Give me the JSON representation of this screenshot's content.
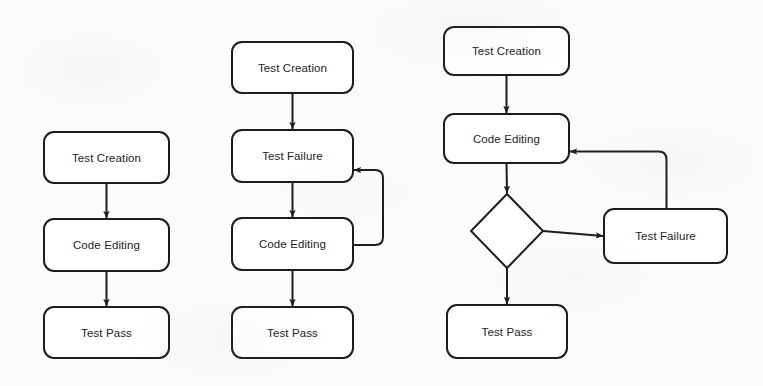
{
  "diagram": {
    "background_color": "#fbfbfa",
    "stroke_color": "#1d1d1d",
    "text_color": "#1d1d1d",
    "node_fill": "#ffffff",
    "stroke_width": 2,
    "corner_radius": 10,
    "flowcharts": [
      {
        "id": "flowchart-a",
        "name": "simple-linear-flow",
        "nodes": [
          {
            "id": "a1",
            "label": "Test Creation",
            "shape": "rounded-rect",
            "x": 44,
            "y": 132,
            "w": 125,
            "h": 51
          },
          {
            "id": "a2",
            "label": "Code Editing",
            "shape": "rounded-rect",
            "x": 44,
            "y": 219,
            "w": 125,
            "h": 52
          },
          {
            "id": "a3",
            "label": "Test Pass",
            "shape": "rounded-rect",
            "x": 44,
            "y": 307,
            "w": 125,
            "h": 51
          }
        ],
        "edges": [
          {
            "from": "a1",
            "to": "a2",
            "type": "straight-down",
            "arrow": true
          },
          {
            "from": "a2",
            "to": "a3",
            "type": "straight-down",
            "arrow": true
          }
        ]
      },
      {
        "id": "flowchart-b",
        "name": "loop-back-flow",
        "nodes": [
          {
            "id": "b1",
            "label": "Test Creation",
            "shape": "rounded-rect",
            "x": 232,
            "y": 42,
            "w": 121,
            "h": 51
          },
          {
            "id": "b2",
            "label": "Test Failure",
            "shape": "rounded-rect",
            "x": 232,
            "y": 130,
            "w": 121,
            "h": 52
          },
          {
            "id": "b3",
            "label": "Code Editing",
            "shape": "rounded-rect",
            "x": 232,
            "y": 218,
            "w": 121,
            "h": 52
          },
          {
            "id": "b4",
            "label": "Test Pass",
            "shape": "rounded-rect",
            "x": 232,
            "y": 307,
            "w": 121,
            "h": 51
          }
        ],
        "edges": [
          {
            "from": "b1",
            "to": "b2",
            "type": "straight-down",
            "arrow": true
          },
          {
            "from": "b2",
            "to": "b3",
            "type": "straight-down",
            "arrow": true
          },
          {
            "from": "b3",
            "to": "b4",
            "type": "straight-down",
            "arrow": true
          },
          {
            "from": "b3",
            "to": "b2",
            "type": "right-loop-up",
            "arrow": true
          }
        ]
      },
      {
        "id": "flowchart-c",
        "name": "decision-branch-flow",
        "nodes": [
          {
            "id": "c1",
            "label": "Test Creation",
            "shape": "rounded-rect",
            "x": 444,
            "y": 27,
            "w": 125,
            "h": 48
          },
          {
            "id": "c2",
            "label": "Code Editing",
            "shape": "rounded-rect",
            "x": 444,
            "y": 114,
            "w": 125,
            "h": 49
          },
          {
            "id": "c3",
            "label": "",
            "shape": "diamond",
            "x": 471,
            "y": 194,
            "w": 72,
            "h": 74
          },
          {
            "id": "c4",
            "label": "Test Pass",
            "shape": "rounded-rect",
            "x": 447,
            "y": 305,
            "w": 120,
            "h": 53
          },
          {
            "id": "c5",
            "label": "Test Failure",
            "shape": "rounded-rect",
            "x": 604,
            "y": 209,
            "w": 123,
            "h": 54
          }
        ],
        "edges": [
          {
            "from": "c1",
            "to": "c2",
            "type": "straight-down",
            "arrow": true
          },
          {
            "from": "c2",
            "to": "c3",
            "type": "straight-down",
            "arrow": true
          },
          {
            "from": "c3",
            "to": "c4",
            "type": "straight-down",
            "arrow": true
          },
          {
            "from": "c3",
            "to": "c5",
            "type": "straight-right",
            "arrow": true
          },
          {
            "from": "c5",
            "to": "c2",
            "type": "up-left-loop",
            "arrow": true
          }
        ]
      }
    ]
  }
}
